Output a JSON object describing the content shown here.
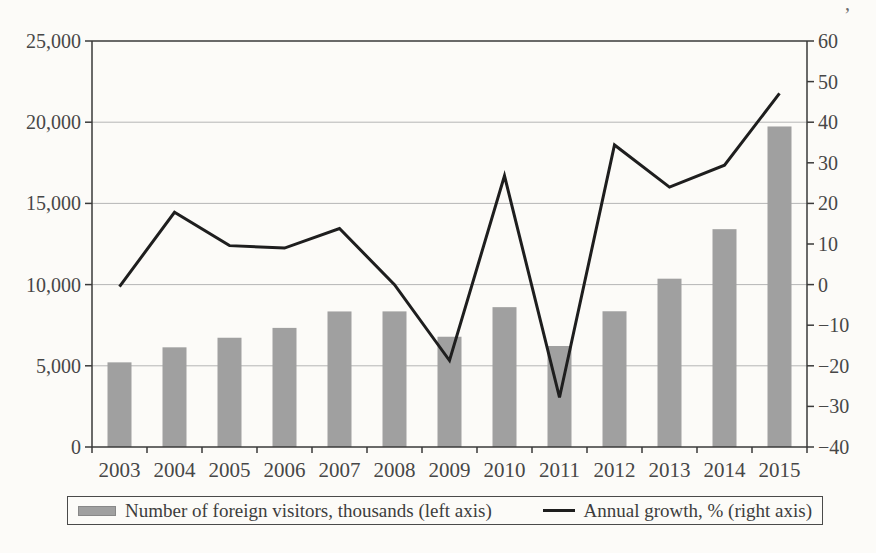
{
  "figure": {
    "background": "#fcfbf8",
    "scan_artifact_glyph": ","
  },
  "chart_data": {
    "type": "combo-bar-line",
    "title": "",
    "xlabel": "",
    "ylabel_left": "",
    "ylabel_right": "",
    "grid": "horizontal",
    "legend_position": "bottom",
    "categories": [
      "2003",
      "2004",
      "2005",
      "2006",
      "2007",
      "2008",
      "2009",
      "2010",
      "2011",
      "2012",
      "2013",
      "2014",
      "2015"
    ],
    "series": [
      {
        "name": "Number of foreign visitors, thousands (left axis)",
        "type": "bar",
        "axis": "left",
        "color": "#a0a0a0",
        "values": [
          5212,
          6138,
          6728,
          7334,
          8347,
          8351,
          6790,
          8611,
          6219,
          8358,
          10364,
          13413,
          19737
        ]
      },
      {
        "name": "Annual growth, % (right axis)",
        "type": "line",
        "axis": "right",
        "color": "#1e1e1e",
        "values": [
          -0.5,
          17.8,
          9.6,
          9.0,
          13.8,
          0.0,
          -18.7,
          26.8,
          -27.8,
          34.4,
          24.0,
          29.4,
          47.1
        ]
      }
    ],
    "left_axis": {
      "min": 0,
      "max": 25000,
      "tick_step": 5000,
      "tick_labels": [
        "0",
        "5,000",
        "10,000",
        "15,000",
        "20,000",
        "25,000"
      ]
    },
    "right_axis": {
      "min": -40,
      "max": 60,
      "tick_step": 10,
      "tick_labels": [
        "−40",
        "−30",
        "−20",
        "−10",
        "0",
        "10",
        "20",
        "30",
        "40",
        "50",
        "60"
      ]
    },
    "style": {
      "gridline_color": "#b6b6b6",
      "axis_color": "#3a3a3a",
      "tick_label_color": "#474747",
      "bar_fill": "#a0a0a0",
      "line_stroke": "#1e1e1e"
    }
  }
}
